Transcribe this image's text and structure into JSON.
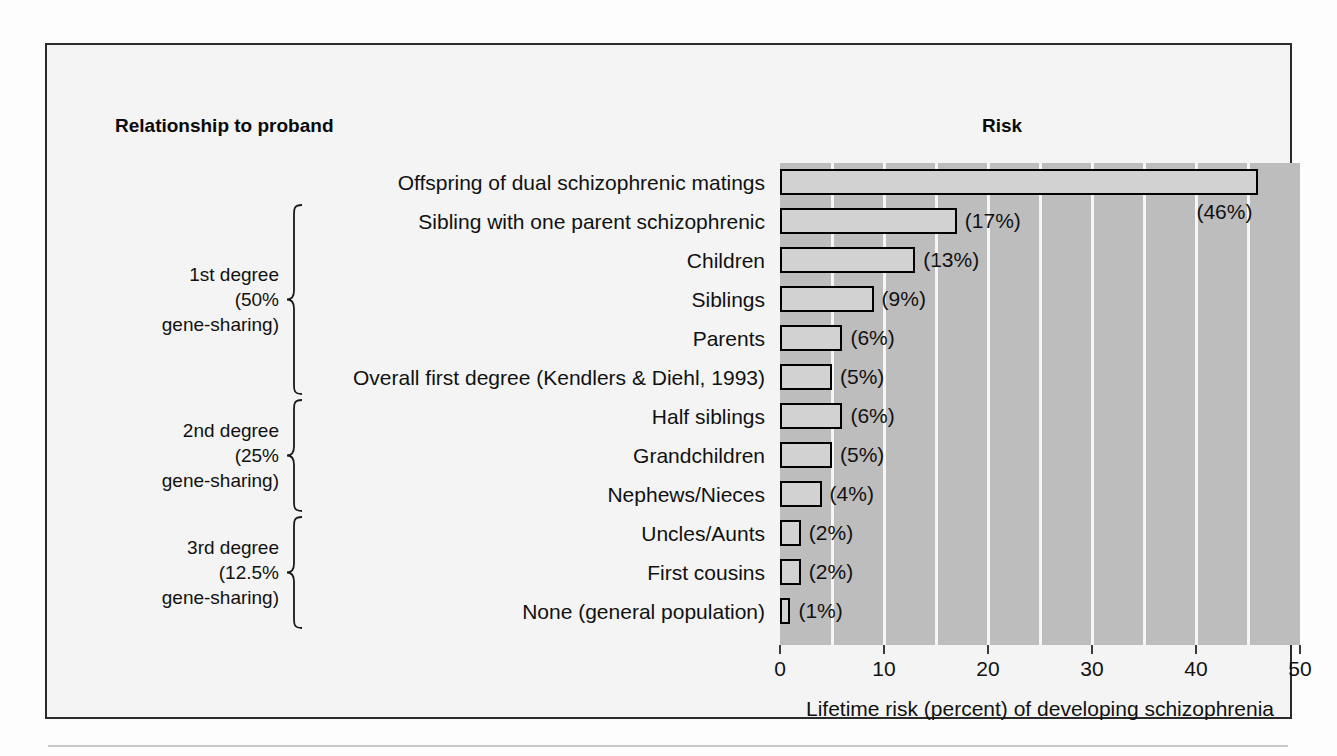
{
  "headers": {
    "left": "Relationship to proband",
    "right": "Risk"
  },
  "axis": {
    "title": "Lifetime risk (percent) of developing schizophrenia",
    "ticks": [
      "0",
      "10",
      "20",
      "30",
      "40",
      "50"
    ]
  },
  "groups": [
    {
      "name": "1st degree",
      "percent": "(50%",
      "suffix": "gene-sharing)"
    },
    {
      "name": "2nd degree",
      "percent": "(25%",
      "suffix": "gene-sharing)"
    },
    {
      "name": "3rd degree",
      "percent": "(12.5%",
      "suffix": "gene-sharing)"
    }
  ],
  "chart_data": {
    "type": "bar",
    "orientation": "horizontal",
    "title": "Risk",
    "xlabel": "Lifetime risk (percent) of developing schizophrenia",
    "ylabel": "Relationship to proband",
    "xlim": [
      0,
      50
    ],
    "xticks": [
      0,
      10,
      20,
      30,
      40,
      50
    ],
    "grid": "vertical gridlines every 5 units, white on gray plot background",
    "legend": "none",
    "categories": [
      "Offspring of dual schizophrenic matings",
      "Sibling with one parent schizophrenic",
      "Children",
      "Siblings",
      "Parents",
      "Overall first degree (Kendlers & Diehl, 1993)",
      "Half siblings",
      "Grandchildren",
      "Nephews/Nieces",
      "Uncles/Aunts",
      "First cousins",
      "None (general population)"
    ],
    "values": [
      46,
      17,
      13,
      9,
      6,
      5,
      6,
      5,
      4,
      2,
      2,
      1
    ],
    "data_labels": [
      "(46%)",
      "(17%)",
      "(13%)",
      "(9%)",
      "(6%)",
      "(5%)",
      "(6%)",
      "(5%)",
      "(4%)",
      "(2%)",
      "(2%)",
      "(1%)"
    ],
    "label_positions": [
      "below",
      "right",
      "right",
      "right",
      "right",
      "right",
      "right",
      "right",
      "right",
      "right",
      "right",
      "right"
    ],
    "group_brackets": [
      {
        "label": "1st degree (50% gene-sharing)",
        "rows": [
          1,
          2,
          3,
          4,
          5
        ]
      },
      {
        "label": "2nd degree (25% gene-sharing)",
        "rows": [
          6,
          7,
          8
        ]
      },
      {
        "label": "3rd degree (12.5% gene-sharing)",
        "rows": [
          9,
          10,
          11
        ]
      }
    ],
    "colors": {
      "plot_background": "#bdbdbd",
      "gridline": "#f6f6f6",
      "bar_fill": "#d2d2d2",
      "bar_outline": "#000000",
      "page_background": "#f4f4f4",
      "text": "#111111"
    }
  }
}
